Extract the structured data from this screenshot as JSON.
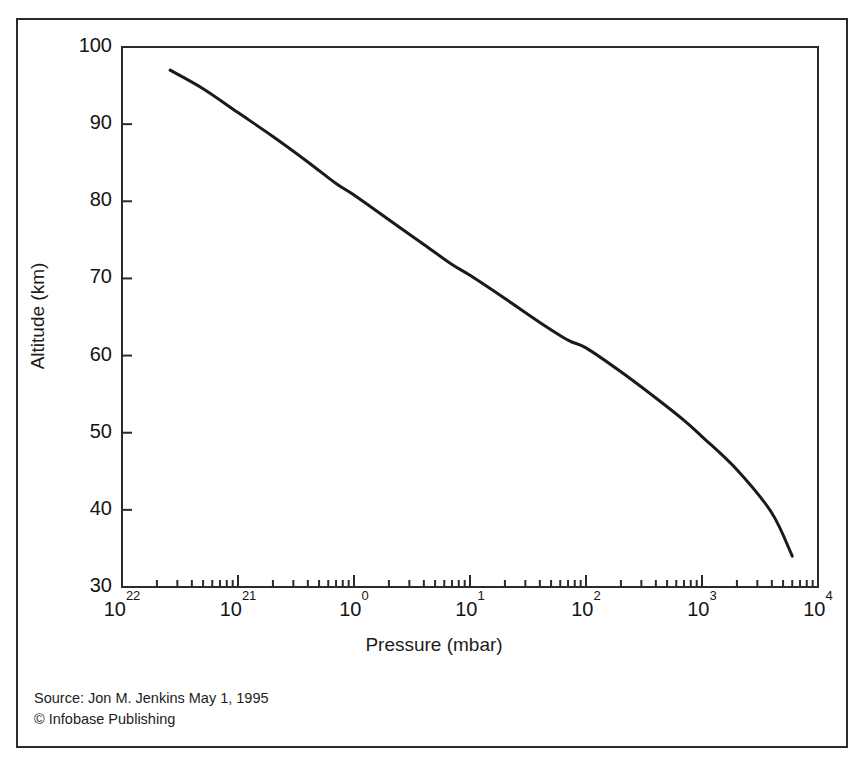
{
  "figure": {
    "border_color": "#2b2b2b",
    "background": "#ffffff"
  },
  "source": {
    "line1": "Source: Jon M. Jenkins May 1, 1995",
    "line2": "© Infobase Publishing"
  },
  "chart_data": {
    "type": "line",
    "title": "",
    "xlabel": "Pressure (mbar)",
    "ylabel": "Altitude (km)",
    "xscale": "log",
    "yscale": "linear",
    "grid": false,
    "legend": null,
    "line_color": "#1a1a1a",
    "line_width": 3,
    "xlim": [
      0.01,
      10000
    ],
    "ylim": [
      30,
      100
    ],
    "xticklabels": [
      "10",
      "10",
      "10",
      "10",
      "10",
      "10",
      "10"
    ],
    "xtick_exponents": [
      "22",
      "21",
      "0",
      "1",
      "2",
      "3",
      "4"
    ],
    "xtick_values": [
      0.01,
      0.1,
      1,
      10,
      100,
      1000,
      10000
    ],
    "yticklabels": [
      "100",
      "90",
      "80",
      "70",
      "60",
      "50",
      "40",
      "30"
    ],
    "ytick_values": [
      100,
      90,
      80,
      70,
      60,
      50,
      40,
      30
    ],
    "series": [
      {
        "name": "Venus atmosphere pressure profile",
        "x": [
          0.026,
          0.05,
          0.1,
          0.2,
          0.4,
          0.7,
          1.0,
          2.0,
          4.0,
          7.0,
          10.0,
          20.0,
          40.0,
          70.0,
          100.0,
          200.0,
          400.0,
          700.0,
          1000.0,
          2000.0,
          4000.0,
          6000.0
        ],
        "y": [
          97.0,
          94.6,
          91.5,
          88.4,
          85.1,
          82.3,
          80.8,
          77.6,
          74.4,
          71.8,
          70.4,
          67.4,
          64.3,
          62.0,
          61.0,
          57.9,
          54.5,
          51.6,
          49.5,
          45.2,
          39.6,
          34.0
        ]
      }
    ]
  }
}
